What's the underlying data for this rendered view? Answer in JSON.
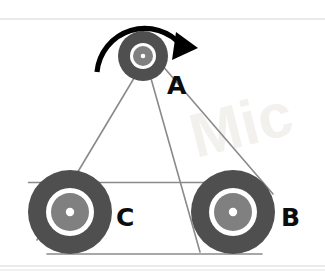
{
  "figure": {
    "type": "mechanical-diagram",
    "width": 325,
    "height": 272,
    "background_color": "#ffffff"
  },
  "colors": {
    "pulley_rim": "#4f4f4f",
    "pulley_ring": "#ffffff",
    "pulley_hub": "#808080",
    "pulley_center": "#ffffff",
    "belt": "#8a8a8a",
    "arrow": "#000000",
    "label": "#0d0d0d",
    "scan_rule": "#e3e3e3",
    "watermark": "#f2f1ee"
  },
  "pulleys": [
    {
      "id": "A",
      "label": "A",
      "cx": 143,
      "cy": 56,
      "outer_r": 25,
      "ring_r": 13,
      "hub_r": 10,
      "center_r": 2.3,
      "label_x": 167,
      "label_y": 94,
      "label_size": 25,
      "size": "small",
      "role": "driver"
    },
    {
      "id": "C",
      "label": "C",
      "cx": 70,
      "cy": 212,
      "outer_r": 42,
      "ring_r": 24,
      "hub_r": 19,
      "center_r": 4.2,
      "label_x": 116,
      "label_y": 226,
      "label_size": 25,
      "size": "large",
      "role": "driven"
    },
    {
      "id": "B",
      "label": "B",
      "cx": 233,
      "cy": 212,
      "outer_r": 42,
      "ring_r": 24,
      "hub_r": 19,
      "center_r": 4.2,
      "label_x": 281,
      "label_y": 226,
      "label_size": 25,
      "size": "large",
      "role": "driven"
    }
  ],
  "belt": {
    "stroke_width": 1.6,
    "segments": [
      {
        "name": "A-to-C-left",
        "x1": 133.5,
        "y1": 79.0,
        "x2": 37.0,
        "y2": 240.0
      },
      {
        "name": "A-to-B-crossed",
        "x1": 151.0,
        "y1": 78.5,
        "x2": 200.0,
        "y2": 252.0
      },
      {
        "name": "A-to-B-right",
        "x1": 161.0,
        "y1": 64.0,
        "x2": 273.0,
        "y2": 194.0
      },
      {
        "name": "C-to-B-top",
        "x1": 28.5,
        "y1": 182.5,
        "x2": 243.0,
        "y2": 182.5
      },
      {
        "name": "C-to-B-bottom",
        "x1": 47.0,
        "y1": 254.0,
        "x2": 262.0,
        "y2": 254.0
      }
    ]
  },
  "rotation_arrow": {
    "name": "rotation-direction-arrow",
    "described_as": "curved arrow over pulley A showing direction of rotation",
    "direction": "clockwise",
    "stroke_width": 5.2,
    "arc_path": "M 97,72 A 48,48 0 0 1 182,46",
    "head_points": "176,32 198,48 172,60"
  },
  "scan_artifacts": {
    "top_rule": {
      "x1": 0,
      "y1": 19,
      "x2": 325,
      "y2": 19,
      "width": 1.4
    },
    "bottom_rule": {
      "x1": 0,
      "y1": 266,
      "x2": 325,
      "y2": 266,
      "width": 1.4
    },
    "bottom_rule_2": {
      "x1": 0,
      "y1": 270,
      "x2": 325,
      "y2": 270,
      "width": 1.2
    }
  },
  "watermark": {
    "text": "Mic",
    "x": 196,
    "y": 158,
    "size": 62,
    "rotate": -14
  }
}
